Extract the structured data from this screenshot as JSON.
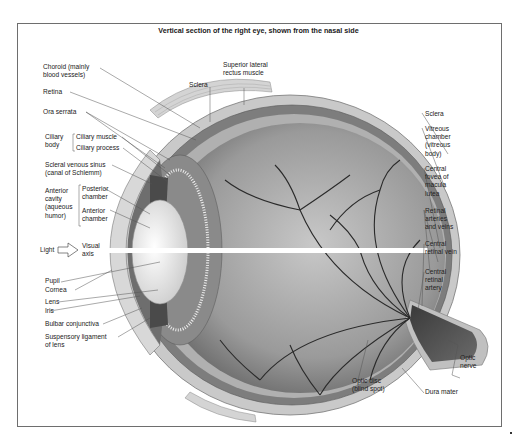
{
  "figure": {
    "title": "Vertical section of the right eye, shown from the nasal side",
    "colors": {
      "frame": "#6e6e6e",
      "sclera": "#c9c9c9",
      "vitreous": "#9a9a9a",
      "vessels": "#2a2a2a",
      "lens": "#eeeeee",
      "leader_lines": "#555555"
    }
  },
  "labels_left": {
    "choroid": [
      "Choroid (mainly",
      "blood vessels)"
    ],
    "retina": "Retina",
    "ora_serrata": "Ora serrata",
    "ciliary_body": [
      "Ciliary",
      "body"
    ],
    "ciliary_muscle": "Ciliary muscle",
    "ciliary_process": "Ciliary process",
    "scleral_venous_sinus": [
      "Scleral venous sinus",
      "(canal of Schlemm)"
    ],
    "anterior_cavity": [
      "Anterior",
      "cavity",
      "(aqueous",
      "humor)"
    ],
    "posterior_chamber": [
      "Posterior",
      "chamber"
    ],
    "anterior_chamber": [
      "Anterior",
      "chamber"
    ],
    "light": "Light",
    "visual_axis": [
      "Visual",
      "axis"
    ],
    "pupil": "Pupil",
    "cornea": "Cornea",
    "lens": "Lens",
    "iris": "Iris",
    "bulbar_conjunctiva": "Bulbar conjunctiva",
    "suspensory_ligament": [
      "Suspensory ligament",
      "of lens"
    ]
  },
  "labels_top": {
    "superior_lateral_rectus": [
      "Superior lateral",
      "rectus muscle"
    ],
    "sclera": "Sclera"
  },
  "labels_right": {
    "sclera": "Sclera",
    "vitreous_chamber": [
      "Vitreous",
      "chamber",
      "(vitreous",
      "body)"
    ],
    "central_fovea": [
      "Central",
      "fovea of",
      "macula",
      "lutea"
    ],
    "retinal_arteries": [
      "Retinal",
      "arteries",
      "and veins"
    ],
    "central_retinal_vein": [
      "Central",
      "retinal vein"
    ],
    "central_retinal_artery": [
      "Central",
      "retinal",
      "artery"
    ],
    "optic_nerve": [
      "Optic",
      "nerve"
    ]
  },
  "labels_bottom": {
    "optic_disc": [
      "Optic disc",
      "(blind spot)"
    ],
    "dura_mater": "Dura mater"
  }
}
